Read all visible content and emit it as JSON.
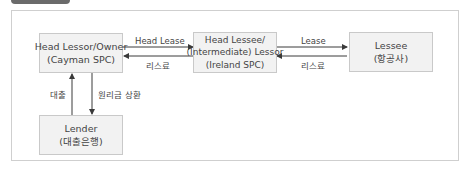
{
  "nodes": {
    "head_lessor": {
      "line1": "Head Lessor/Owner",
      "line2": "(Cayman SPC)"
    },
    "head_lessee": {
      "line1": "Head Lessee/",
      "line2": "(Intermediate) Lessor",
      "line3": "(Ireland SPC)"
    },
    "lessee": {
      "line1": "Lessee",
      "line2": "(항공사)"
    },
    "lender": {
      "line1": "Lender",
      "line2": "(대출은행)"
    }
  },
  "edges": {
    "head_lease": "Head Lease",
    "rent_to_owner": "리스료",
    "lease": "Lease",
    "rent_to_lessor": "리스료",
    "loan": "대출",
    "repayment": "원리금 상환"
  },
  "colors": {
    "box_fill": "#f2f2f2",
    "box_border": "#c9c9c9",
    "frame_border": "#cfcfcf",
    "arrow": "#3a3a3a",
    "tab": "#6b6b6b"
  }
}
